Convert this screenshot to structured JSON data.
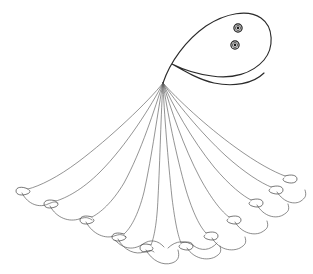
{
  "figure": {
    "background_color": "#ffffff",
    "line_color": "#4a4a4a",
    "body_outline_color": "#2b2b2b",
    "marking_color": "#1c1c1c",
    "canvas": {
      "width": 313,
      "height": 274
    }
  },
  "diagram_data": {
    "type": "line-art",
    "parts": [
      {
        "id": "bell",
        "label": "bell",
        "shape": "comma",
        "outline_path": "M 163 83 C 170 62 186 40 206 26 C 226 13 248 9 261 18 C 274 27 274 48 264 60 C 252 74 232 79 212 76 C 196 74 182 69 172 64 C 186 72 200 80 214 83 C 233 87 253 84 264 73",
        "stroke_width": 1.15
      },
      {
        "id": "ocellus-upper",
        "label": "upper marking",
        "shape": "concentric-circles",
        "cx": 238,
        "cy": 28,
        "radii": [
          4.1,
          2.6,
          1.4
        ]
      },
      {
        "id": "ocellus-lower",
        "label": "lower marking",
        "shape": "concentric-circles",
        "cx": 235,
        "cy": 45,
        "radii": [
          4.1,
          2.6,
          1.4
        ]
      },
      {
        "id": "origin",
        "label": "tentacle convergence point",
        "x": 163,
        "y": 83
      }
    ],
    "tentacle_count": 11,
    "tentacles": [
      {
        "index": 1,
        "label": "tentacle-1",
        "path": "M 163 83 C 148 102 110 138 78 162 C 58 177 40 186 28 189",
        "tip_x": 28,
        "tip_y": 189
      },
      {
        "index": 2,
        "label": "tentacle-2",
        "path": "M 163 83 C 152 105 126 146 100 172 C 82 190 66 198 56 201",
        "tip_x": 56,
        "tip_y": 201
      },
      {
        "index": 3,
        "label": "tentacle-3",
        "path": "M 163 83 C 155 108 141 152 124 183 C 112 203 100 213 92 217",
        "tip_x": 92,
        "tip_y": 217
      },
      {
        "index": 4,
        "label": "tentacle-4",
        "path": "M 163 83 C 158 110 152 156 144 192 C 138 216 130 229 124 234",
        "tip_x": 124,
        "tip_y": 234
      },
      {
        "index": 5,
        "label": "tentacle-5",
        "path": "M 163 83 C 161 112 160 160 158 198 C 157 223 154 238 151 245",
        "tip_x": 151,
        "tip_y": 245
      },
      {
        "index": 6,
        "label": "tentacle-6",
        "path": "M 163 83 C 164 112 168 160 172 198 C 175 222 178 236 181 243",
        "tip_x": 181,
        "tip_y": 243
      },
      {
        "index": 7,
        "label": "tentacle-7",
        "path": "M 163 83 C 167 110 176 155 186 190 C 193 213 200 227 206 233",
        "tip_x": 206,
        "tip_y": 233
      },
      {
        "index": 8,
        "label": "tentacle-8",
        "path": "M 163 83 C 170 107 184 148 200 178 C 212 200 222 212 229 217",
        "tip_x": 229,
        "tip_y": 217
      },
      {
        "index": 9,
        "label": "tentacle-9",
        "path": "M 163 83 C 172 104 192 140 214 167 C 230 186 243 196 251 200",
        "tip_x": 251,
        "tip_y": 200
      },
      {
        "index": 10,
        "label": "tentacle-10",
        "path": "M 163 83 C 175 101 200 132 226 156 C 245 173 261 183 271 187",
        "tip_x": 271,
        "tip_y": 187
      },
      {
        "index": 11,
        "label": "tentacle-11",
        "path": "M 163 83 C 177 99 206 126 235 147 C 257 163 274 172 285 176",
        "tip_x": 285,
        "tip_y": 176
      }
    ],
    "tip_curls": [
      {
        "index": 1,
        "path": "M 28 189 C 22 186 16 187 16 191 C 16 195 22 196 27 194 C 30 193 31 191 29 190"
      },
      {
        "index": 2,
        "path": "M 56 201 C 50 199 44 200 44 204 C 44 208 50 209 55 207 C 58 206 59 204 57 203"
      },
      {
        "index": 3,
        "path": "M 92 217 C 86 215 80 216 80 220 C 80 224 86 225 91 223 C 94 222 95 220 93 219"
      },
      {
        "index": 4,
        "path": "M 124 234 C 118 232 112 233 112 237 C 112 241 118 242 123 240 C 126 239 127 237 125 236"
      },
      {
        "index": 5,
        "path": "M 151 245 C 145 243 140 244 140 248 C 140 252 146 253 150 251 C 153 250 154 248 152 247"
      },
      {
        "index": 6,
        "path": "M 181 243 C 187 241 193 242 193 246 C 193 250 187 251 182 249 C 179 248 178 246 180 245"
      },
      {
        "index": 7,
        "path": "M 206 233 C 212 231 218 232 218 236 C 218 240 212 241 207 239 C 204 238 203 236 205 235"
      },
      {
        "index": 8,
        "path": "M 229 217 C 235 215 241 216 241 220 C 241 224 235 225 230 223 C 227 222 226 220 228 219"
      },
      {
        "index": 9,
        "path": "M 251 200 C 257 198 263 199 263 203 C 263 207 257 208 252 206 C 249 205 248 203 250 202"
      },
      {
        "index": 10,
        "path": "M 271 187 C 277 185 283 186 283 190 C 283 194 277 195 272 193 C 269 192 268 190 270 189"
      },
      {
        "index": 11,
        "path": "M 285 176 C 291 174 297 175 297 179 C 297 183 291 184 286 182 C 283 181 282 179 284 178"
      }
    ],
    "margin_scallops": [
      {
        "index": 1,
        "label": "margin-1-2",
        "path": "M 22 193 C 28 205 40 208 48 204 C 53 202 55 201 58 203"
      },
      {
        "index": 2,
        "label": "margin-2-3",
        "path": "M 50 206 C 57 219 70 222 79 219 C 85 217 88 217 92 220"
      },
      {
        "index": 3,
        "label": "margin-3-4",
        "path": "M 86 222 C 93 235 106 239 114 236 C 120 234 122 234 126 237"
      },
      {
        "index": 4,
        "label": "margin-4-5",
        "path": "M 118 239 C 124 251 136 255 144 252 C 149 250 152 250 154 252"
      },
      {
        "index": 5,
        "label": "margin-5-6",
        "path": "M 146 250 C 152 261 163 266 172 263 C 178 261 180 257 178 250"
      },
      {
        "index": 6,
        "label": "margin-6-7",
        "path": "M 187 248 C 194 259 207 261 215 257 C 220 254 222 252 220 246"
      },
      {
        "index": 7,
        "label": "margin-7-8",
        "path": "M 212 238 C 219 250 232 252 240 248 C 245 245 247 243 245 237"
      },
      {
        "index": 8,
        "label": "margin-8-9",
        "path": "M 235 222 C 242 234 255 236 262 232 C 267 229 269 227 267 221"
      },
      {
        "index": 9,
        "label": "margin-9-10",
        "path": "M 257 205 C 264 217 276 219 283 215 C 288 212 290 210 288 204"
      },
      {
        "index": 10,
        "label": "margin-10-11",
        "path": "M 277 192 C 284 203 295 205 301 201 C 305 198 307 196 305 190"
      }
    ],
    "margin_waves": [
      {
        "index": 1,
        "label": "wave-left",
        "path": "M 115 240 C 124 250 134 250 143 244 C 150 239 158 240 164 247"
      },
      {
        "index": 2,
        "label": "wave-right",
        "path": "M 168 248 C 176 240 186 240 194 246 C 201 251 210 251 217 243"
      }
    ]
  }
}
